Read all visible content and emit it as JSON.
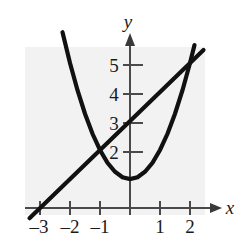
{
  "figure": {
    "title": "",
    "axis_labels": {
      "x": "x",
      "y": "y"
    },
    "x_tick_labels": [
      "–3",
      "–2",
      "–1",
      "1",
      "2"
    ],
    "y_tick_labels": [
      "5",
      "4",
      "3",
      "2"
    ],
    "colors": {
      "plot_background": "#f2f2f2",
      "axis": "#4a4a4a",
      "curve": "#111111",
      "text": "#1a1a1a",
      "page_background": "#ffffff"
    }
  },
  "chart_data": {
    "type": "line",
    "title": "",
    "xlabel": "x",
    "ylabel": "y",
    "xlim": [
      -3.6,
      2.9
    ],
    "ylim": [
      -0.75,
      6.2
    ],
    "xticks": [
      -3,
      -2,
      -1,
      1,
      2
    ],
    "yticks": [
      2,
      3,
      4,
      5
    ],
    "xtick_labels": [
      "–3",
      "–2",
      "–1",
      "1",
      "2"
    ],
    "ytick_labels": [
      "2",
      "3",
      "4",
      "5"
    ],
    "grid": false,
    "legend": "none",
    "series": [
      {
        "name": "parabola",
        "equation": "y = x^2 + 1",
        "type": "quadratic",
        "vertex": [
          0,
          1
        ],
        "x": [
          -2.25,
          -2.0,
          -1.75,
          -1.5,
          -1.25,
          -1.0,
          -0.75,
          -0.5,
          -0.25,
          0,
          0.25,
          0.5,
          0.75,
          1.0,
          1.25,
          1.5,
          1.75,
          2.0,
          2.15
        ],
        "values": [
          6.06,
          5.0,
          4.06,
          3.25,
          2.56,
          2.0,
          1.56,
          1.25,
          1.06,
          1.0,
          1.06,
          1.25,
          1.56,
          2.0,
          2.56,
          3.25,
          4.06,
          5.0,
          5.62
        ]
      },
      {
        "name": "line",
        "equation": "y = x + 3",
        "type": "linear",
        "slope": 1,
        "intercept": 3,
        "x": [
          -3.35,
          2.45
        ],
        "values": [
          -0.35,
          5.45
        ]
      }
    ],
    "intersections": [
      [
        -1,
        2
      ],
      [
        2,
        5
      ]
    ],
    "x_intercepts_line": [
      -3
    ],
    "y_intercept_line": 3
  }
}
